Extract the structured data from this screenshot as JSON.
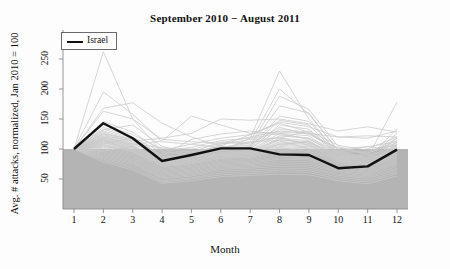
{
  "chart_data": {
    "type": "line",
    "title": "September 2010 − August 2011",
    "xlabel": "Month",
    "ylabel": "Avg. # attacks, normalized, Jan 2010 = 100",
    "x": [
      1,
      2,
      3,
      4,
      5,
      6,
      7,
      8,
      9,
      10,
      11,
      12
    ],
    "xtick_labels": [
      "1",
      "2",
      "3",
      "4",
      "5",
      "6",
      "7",
      "8",
      "9",
      "10",
      "11",
      "12"
    ],
    "ytick_labels": [
      "50",
      "100",
      "150",
      "200",
      "250"
    ],
    "ytick_values": [
      50,
      100,
      150,
      200,
      250
    ],
    "ylim": [
      30,
      262
    ],
    "xlim": [
      0.6,
      12.4
    ],
    "grid": false,
    "legend": {
      "position": "top-left",
      "entries": [
        {
          "name": "Israel",
          "color": "#111111",
          "style": "solid",
          "width": 2.4
        }
      ]
    },
    "annotations": [
      {
        "text": "Shaded gray band marks the region below the normalized value 100",
        "value": 100
      }
    ],
    "shaded_band": {
      "from": 30,
      "to": 100,
      "color": "#b4b4b4"
    },
    "background_series_color": "#c8c8c8",
    "series": [
      {
        "name": "Israel",
        "highlight": true,
        "color": "#111111",
        "values": [
          100,
          143,
          118,
          80,
          90,
          101,
          101,
          91,
          90,
          68,
          71,
          99
        ]
      },
      {
        "name": "country-01",
        "values": [
          100,
          262,
          150,
          96,
          90,
          101,
          110,
          120,
          106,
          86,
          92,
          118
        ]
      },
      {
        "name": "country-02",
        "values": [
          100,
          195,
          158,
          112,
          108,
          118,
          124,
          143,
          128,
          95,
          100,
          120
        ]
      },
      {
        "name": "country-03",
        "values": [
          100,
          168,
          177,
          143,
          120,
          105,
          124,
          145,
          137,
          120,
          118,
          130
        ]
      },
      {
        "name": "country-04",
        "values": [
          100,
          163,
          150,
          116,
          112,
          110,
          120,
          130,
          126,
          100,
          104,
          112
        ]
      },
      {
        "name": "country-05",
        "values": [
          100,
          146,
          128,
          96,
          103,
          114,
          118,
          230,
          150,
          92,
          88,
          105
        ]
      },
      {
        "name": "country-06",
        "values": [
          100,
          140,
          124,
          100,
          100,
          109,
          112,
          200,
          158,
          98,
          94,
          108
        ]
      },
      {
        "name": "country-07",
        "values": [
          100,
          136,
          120,
          94,
          96,
          104,
          106,
          188,
          166,
          104,
          90,
          100
        ]
      },
      {
        "name": "country-08",
        "values": [
          100,
          133,
          118,
          90,
          95,
          102,
          104,
          172,
          160,
          96,
          86,
          178
        ]
      },
      {
        "name": "country-09",
        "values": [
          100,
          130,
          116,
          88,
          92,
          100,
          103,
          155,
          146,
          94,
          84,
          134
        ]
      },
      {
        "name": "country-10",
        "values": [
          100,
          128,
          114,
          86,
          92,
          99,
          102,
          148,
          140,
          92,
          83,
          126
        ]
      },
      {
        "name": "country-11",
        "values": [
          100,
          126,
          112,
          85,
          90,
          98,
          100,
          140,
          133,
          91,
          82,
          118
        ]
      },
      {
        "name": "country-12",
        "values": [
          100,
          124,
          110,
          84,
          89,
          97,
          100,
          133,
          128,
          90,
          81,
          112
        ]
      },
      {
        "name": "country-13",
        "values": [
          100,
          122,
          113,
          118,
          126,
          150,
          148,
          150,
          142,
          130,
          137,
          128
        ]
      },
      {
        "name": "country-14",
        "values": [
          100,
          120,
          108,
          113,
          155,
          140,
          126,
          128,
          126,
          120,
          122,
          120
        ]
      },
      {
        "name": "country-15",
        "values": [
          100,
          118,
          106,
          82,
          86,
          95,
          98,
          126,
          122,
          88,
          79,
          108
        ]
      },
      {
        "name": "country-16",
        "values": [
          100,
          117,
          105,
          81,
          85,
          94,
          97,
          122,
          118,
          87,
          78,
          106
        ]
      },
      {
        "name": "country-17",
        "values": [
          100,
          116,
          104,
          80,
          84,
          93,
          96,
          118,
          114,
          86,
          78,
          104
        ]
      },
      {
        "name": "country-18",
        "values": [
          100,
          115,
          103,
          79,
          83,
          92,
          95,
          115,
          112,
          85,
          77,
          102
        ]
      },
      {
        "name": "country-19",
        "values": [
          100,
          114,
          102,
          78,
          82,
          91,
          94,
          112,
          110,
          84,
          76,
          100
        ]
      },
      {
        "name": "country-20",
        "values": [
          100,
          113,
          101,
          77,
          81,
          90,
          93,
          110,
          108,
          83,
          76,
          99
        ]
      },
      {
        "name": "country-21",
        "values": [
          100,
          112,
          100,
          76,
          81,
          90,
          92,
          108,
          106,
          82,
          75,
          98
        ]
      },
      {
        "name": "country-22",
        "values": [
          100,
          111,
          99,
          75,
          80,
          89,
          91,
          106,
          104,
          82,
          75,
          97
        ]
      },
      {
        "name": "country-23",
        "values": [
          100,
          110,
          98,
          74,
          79,
          88,
          90,
          104,
          102,
          81,
          74,
          96
        ]
      },
      {
        "name": "country-24",
        "values": [
          100,
          108,
          97,
          73,
          78,
          87,
          89,
          102,
          100,
          80,
          73,
          94
        ]
      },
      {
        "name": "country-25",
        "values": [
          100,
          107,
          96,
          72,
          77,
          86,
          88,
          100,
          98,
          79,
          72,
          92
        ]
      },
      {
        "name": "country-26",
        "values": [
          100,
          106,
          95,
          71,
          76,
          85,
          87,
          98,
          96,
          78,
          71,
          90
        ]
      },
      {
        "name": "country-27",
        "values": [
          100,
          105,
          94,
          70,
          75,
          84,
          86,
          96,
          94,
          77,
          70,
          88
        ]
      },
      {
        "name": "country-28",
        "values": [
          100,
          103,
          92,
          68,
          73,
          82,
          84,
          94,
          92,
          75,
          69,
          86
        ]
      },
      {
        "name": "country-29",
        "values": [
          100,
          101,
          90,
          66,
          71,
          80,
          82,
          91,
          89,
          73,
          67,
          84
        ]
      },
      {
        "name": "country-30",
        "values": [
          100,
          99,
          88,
          64,
          69,
          78,
          80,
          88,
          86,
          71,
          65,
          82
        ]
      },
      {
        "name": "country-31",
        "values": [
          100,
          97,
          86,
          62,
          67,
          76,
          78,
          85,
          84,
          69,
          63,
          80
        ]
      },
      {
        "name": "country-32",
        "values": [
          100,
          95,
          84,
          60,
          65,
          74,
          76,
          83,
          82,
          67,
          61,
          78
        ]
      },
      {
        "name": "country-33",
        "values": [
          100,
          93,
          82,
          58,
          63,
          72,
          74,
          80,
          79,
          65,
          59,
          76
        ]
      },
      {
        "name": "country-34",
        "values": [
          100,
          91,
          80,
          56,
          61,
          70,
          72,
          77,
          76,
          63,
          57,
          74
        ]
      },
      {
        "name": "country-35",
        "values": [
          100,
          89,
          78,
          54,
          59,
          68,
          70,
          74,
          73,
          61,
          55,
          71
        ]
      },
      {
        "name": "country-36",
        "values": [
          100,
          87,
          76,
          52,
          57,
          66,
          68,
          71,
          70,
          58,
          53,
          68
        ]
      },
      {
        "name": "country-37",
        "values": [
          100,
          85,
          74,
          50,
          55,
          63,
          65,
          68,
          67,
          56,
          51,
          65
        ]
      },
      {
        "name": "country-38",
        "values": [
          100,
          83,
          71,
          47,
          52,
          60,
          62,
          65,
          64,
          53,
          48,
          62
        ]
      },
      {
        "name": "country-39",
        "values": [
          100,
          81,
          68,
          45,
          50,
          57,
          59,
          62,
          61,
          50,
          45,
          59
        ]
      },
      {
        "name": "country-40",
        "values": [
          100,
          78,
          65,
          43,
          47,
          54,
          56,
          58,
          57,
          47,
          42,
          55
        ]
      },
      {
        "name": "country-41",
        "values": [
          100,
          109,
          118,
          86,
          92,
          106,
          95,
          116,
          110,
          88,
          80,
          103
        ]
      },
      {
        "name": "country-42",
        "values": [
          100,
          119,
          107,
          92,
          98,
          96,
          118,
          126,
          116,
          93,
          96,
          110
        ]
      },
      {
        "name": "country-43",
        "values": [
          100,
          132,
          140,
          104,
          94,
          112,
          108,
          136,
          124,
          102,
          92,
          114
        ]
      },
      {
        "name": "country-44",
        "values": [
          100,
          125,
          116,
          89,
          116,
          125,
          130,
          124,
          118,
          96,
          104,
          98
        ]
      },
      {
        "name": "country-45",
        "values": [
          100,
          104,
          98,
          98,
          108,
          102,
          112,
          114,
          100,
          94,
          86,
          92
        ]
      },
      {
        "name": "country-46",
        "values": [
          100,
          96,
          104,
          84,
          88,
          92,
          86,
          102,
          96,
          84,
          88,
          90
        ]
      },
      {
        "name": "country-47",
        "values": [
          100,
          121,
          109,
          102,
          90,
          108,
          116,
          118,
          130,
          106,
          98,
          106
        ]
      },
      {
        "name": "country-48",
        "values": [
          100,
          115,
          96,
          76,
          86,
          98,
          92,
          108,
          112,
          90,
          84,
          96
        ]
      }
    ]
  },
  "axis": {
    "y_ticks": [
      {
        "label": "50",
        "value": 50
      },
      {
        "label": "100",
        "value": 100
      },
      {
        "label": "150",
        "value": 150
      },
      {
        "label": "200",
        "value": 200
      },
      {
        "label": "250",
        "value": 250
      }
    ],
    "x_ticks": [
      {
        "label": "1",
        "value": 1
      },
      {
        "label": "2",
        "value": 2
      },
      {
        "label": "3",
        "value": 3
      },
      {
        "label": "4",
        "value": 4
      },
      {
        "label": "5",
        "value": 5
      },
      {
        "label": "6",
        "value": 6
      },
      {
        "label": "7",
        "value": 7
      },
      {
        "label": "8",
        "value": 8
      },
      {
        "label": "9",
        "value": 9
      },
      {
        "label": "10",
        "value": 10
      },
      {
        "label": "11",
        "value": 11
      },
      {
        "label": "12",
        "value": 12
      }
    ]
  },
  "legend": {
    "label": "Israel"
  },
  "colors": {
    "highlight_line": "#111111",
    "background_lines": "#c8c8c8",
    "band_fill": "#b4b4b4",
    "axis": "#8a8a8a",
    "text": "#111111"
  }
}
